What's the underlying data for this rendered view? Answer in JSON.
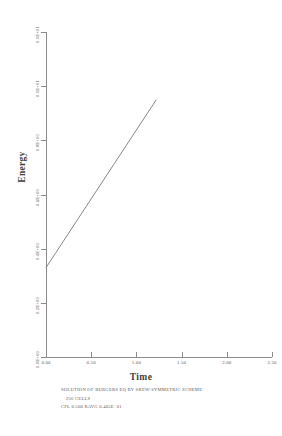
{
  "chart_data": {
    "type": "line",
    "title": "",
    "xlabel": "Time",
    "ylabel": "Energy",
    "xlim": [
      0.0,
      2.5
    ],
    "ylim": [
      0.0,
      1.2
    ],
    "grid": false,
    "legend": null,
    "xticks": [
      "0.00",
      "0.50",
      "1.00",
      "1.50",
      "2.00",
      "2.50"
    ],
    "xtick_values": [
      0.0,
      0.5,
      1.0,
      1.5,
      2.0,
      2.5
    ],
    "yticks": [
      "0.0E+00",
      "0.2E+00",
      "0.4E+00",
      "0.6E+00",
      "0.8E+00",
      "0.1E+01",
      "0.1E+01"
    ],
    "ytick_values": [
      0.0,
      0.2,
      0.4,
      0.6,
      0.8,
      1.0,
      1.2
    ],
    "series": [
      {
        "name": "energy",
        "x": [
          0.0,
          1.22
        ],
        "y": [
          0.33,
          0.95
        ],
        "color": "#7a7a7a"
      }
    ]
  },
  "caption": {
    "line1": "SOLUTION OF BURGERS EQ BY SKEW-SYMMETRIC SCHEME",
    "line2": "256 CELLS",
    "line3": "CFL 0.500 RAVG 0.405E+01"
  },
  "colors": {
    "axis": "#8c8c8c",
    "curve": "#7a7a7a",
    "text": "#4a4a4a",
    "background": "#ffffff"
  }
}
